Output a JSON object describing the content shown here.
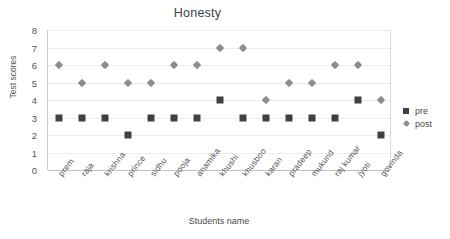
{
  "chart_data": {
    "type": "scatter",
    "title": "Honesty",
    "xlabel": "Students name",
    "ylabel": "Test scores",
    "categories": [
      "prem",
      "raja",
      "krishna",
      "prince",
      "sidhu",
      "pooja",
      "anamika",
      "khushi",
      "khusboo",
      "karan",
      "pradeep",
      "mukund",
      "raj kumar",
      "jyoti",
      "govinda"
    ],
    "series": [
      {
        "name": "pre",
        "marker": "square",
        "color": "#404040",
        "values": [
          3,
          3,
          3,
          2,
          3,
          3,
          3,
          4,
          3,
          3,
          3,
          3,
          3,
          4,
          2
        ]
      },
      {
        "name": "post",
        "marker": "diamond",
        "color": "#8c8c8c",
        "values": [
          6,
          5,
          6,
          5,
          5,
          6,
          6,
          7,
          7,
          4,
          5,
          5,
          6,
          6,
          4
        ]
      }
    ],
    "ylim": [
      0,
      8
    ],
    "yticks": [
      0,
      1,
      2,
      3,
      4,
      5,
      6,
      7,
      8
    ],
    "grid": true,
    "legend_position": "right"
  },
  "legend": {
    "items": [
      {
        "label": "pre"
      },
      {
        "label": "post"
      }
    ]
  }
}
